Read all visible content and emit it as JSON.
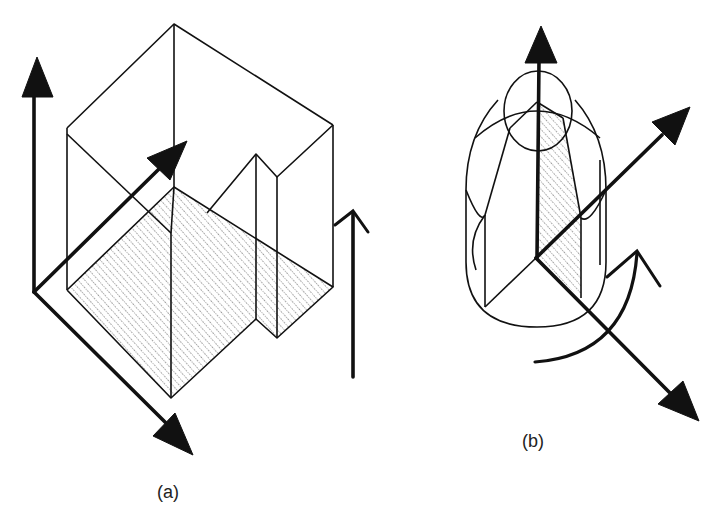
{
  "figure": {
    "panels": [
      {
        "id": "a",
        "label": "(a)",
        "description": "Isometric box with L-shaped stepped notch, hatched section plane, and three coordinate axes plus a vertical translation arrow"
      },
      {
        "id": "b",
        "label": "(b)",
        "description": "Capsule-shaped body of intersecting circles with hatched section, three coordinate axes and a curved rotation arrow"
      }
    ],
    "colors": {
      "ink": "#111111",
      "background": "#ffffff",
      "hatch": "#333333"
    }
  }
}
